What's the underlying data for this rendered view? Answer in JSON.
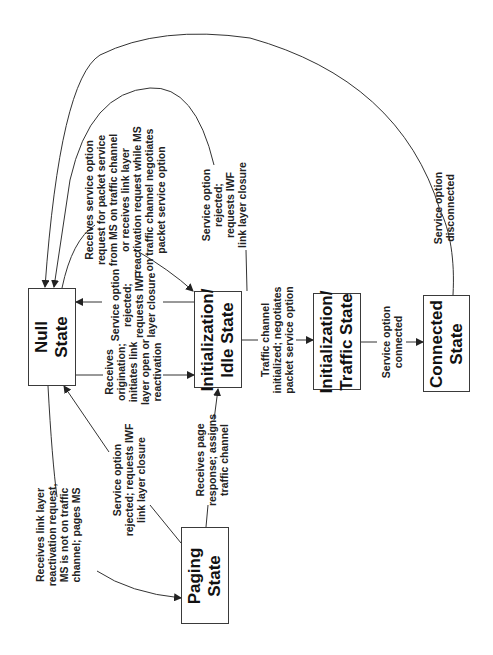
{
  "diagram": {
    "type": "state-transition",
    "orientation": "rotated-90-ccw",
    "states": [
      {
        "id": "null",
        "label": "Null\nState"
      },
      {
        "id": "idle",
        "label": "Initialization/\nIdle State"
      },
      {
        "id": "traffic",
        "label": "Initialization/\nTraffic State"
      },
      {
        "id": "connected",
        "label": "Connected\nState"
      },
      {
        "id": "paging",
        "label": "Paging\nState"
      }
    ],
    "transitions": [
      {
        "id": "t1",
        "from": "idle",
        "to": "null",
        "label": "Service option\nrejected;\nrequests IWF\nlayer closure"
      },
      {
        "id": "t2",
        "from": "null",
        "to": "idle",
        "label": "Receives\norigination;\ninitiates link\nlayer open or\nreactivation"
      },
      {
        "id": "t3",
        "from": "null",
        "to": "idle",
        "label": "Receives service option\nrequest for packet service\nfrom MS on traffic channel\nor receives link layer\nreactivation request while MS\non traffic channel negotiates\npacket service option"
      },
      {
        "id": "t4",
        "from": "traffic",
        "to": "null",
        "label": "Service option\nrejected;\nrequests IWF\nlink layer closure"
      },
      {
        "id": "t5",
        "from": "idle",
        "to": "traffic",
        "label": "Traffic channel\ninitialized; negotiates\npacket service option"
      },
      {
        "id": "t6",
        "from": "traffic",
        "to": "connected",
        "label": "Service option\nconnected"
      },
      {
        "id": "t7",
        "from": "connected",
        "to": "null",
        "label": "Service option\ndisconnected"
      },
      {
        "id": "t8",
        "from": "null",
        "to": "paging",
        "label": "Receives link layer\nreactivation request,\nMS is not on traffic\nchannel; pages MS"
      },
      {
        "id": "t9",
        "from": "paging",
        "to": "null",
        "label": "Service option\nrejected; requests IWF\nlink layer closure"
      },
      {
        "id": "t10",
        "from": "paging",
        "to": "idle",
        "label": "Receives page\nresponse; assigns\ntraffic channel"
      }
    ]
  }
}
